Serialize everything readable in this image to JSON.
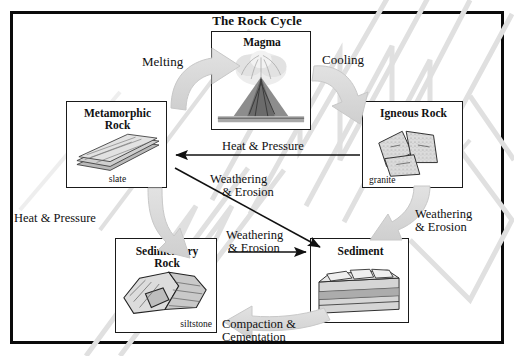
{
  "diagram": {
    "title": "The Rock Cycle",
    "frame_color": "#0a0a0a",
    "arrow_gray": "#d9d9d9",
    "arrow_black": "#111111"
  },
  "nodes": [
    {
      "id": "magma",
      "label": "Magma",
      "caption": "",
      "image": "volcano-illustration"
    },
    {
      "id": "metamorphic",
      "label": "Metamorphic\nRock",
      "caption": "slate",
      "image": "slate-rock-illustration"
    },
    {
      "id": "igneous",
      "label": "Igneous Rock",
      "caption": "granite",
      "image": "granite-rock-illustration"
    },
    {
      "id": "sedimentary",
      "label": "Sedimentary\nRock",
      "caption": "siltstone",
      "image": "siltstone-rock-illustration"
    },
    {
      "id": "sediment",
      "label": "Sediment",
      "caption": "",
      "image": "sediment-layers-illustration"
    }
  ],
  "process_labels": {
    "melting": "Melting",
    "cooling": "Cooling",
    "heat_pressure_top": "Heat & Pressure",
    "heat_pressure_left": "Heat & Pressure",
    "weathering_erosion_diagonal_line1": "Weathering",
    "weathering_erosion_diagonal_line2": "& Erosion",
    "weathering_erosion_middle_line1": "Weathering",
    "weathering_erosion_middle_line2": "& Erosion",
    "weathering_erosion_right_line1": "Weathering",
    "weathering_erosion_right_line2": "& Erosion",
    "compaction_line1": "Compaction &",
    "compaction_line2": "Cementation"
  },
  "node_labels": {
    "magma": "Magma",
    "metamorphic_line1": "Metamorphic",
    "metamorphic_line2": "Rock",
    "metamorphic_caption": "slate",
    "igneous": "Igneous Rock",
    "igneous_caption": "granite",
    "sedimentary_line1": "Sedimentary",
    "sedimentary_line2": "Rock",
    "sedimentary_caption": "siltstone",
    "sediment": "Sediment"
  }
}
